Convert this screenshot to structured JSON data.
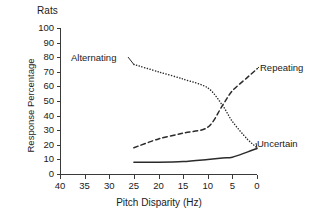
{
  "chart_data": {
    "type": "line",
    "title": "Rats",
    "xlabel": "Pitch Disparity (Hz)",
    "ylabel": "Response Percentage",
    "xlim": [
      40,
      0
    ],
    "ylim": [
      0,
      100
    ],
    "x_reversed": true,
    "grid": false,
    "legend_position": "inline-labels",
    "xticks": [
      40,
      35,
      30,
      25,
      20,
      15,
      10,
      5,
      0
    ],
    "yticks": [
      0,
      10,
      20,
      30,
      40,
      50,
      60,
      70,
      80,
      90,
      100
    ],
    "xtick_labels": [
      "40",
      "35",
      "30",
      "25",
      "20",
      "15",
      "10",
      "5",
      "0"
    ],
    "ytick_labels": [
      "0",
      "10",
      "20",
      "30",
      "40",
      "50",
      "60",
      "70",
      "80",
      "90",
      "100"
    ],
    "x": [
      25,
      20,
      15,
      10,
      7,
      5,
      2,
      0
    ],
    "series": [
      {
        "name": "Alternating",
        "style": "dotted",
        "color": "#2b2b2b",
        "values": [
          75,
          70,
          65,
          59,
          47,
          36,
          24,
          18
        ]
      },
      {
        "name": "Repeating",
        "style": "dashed",
        "color": "#2b2b2b",
        "values": [
          18,
          24,
          28,
          32,
          47,
          57,
          66,
          72
        ]
      },
      {
        "name": "Uncertain",
        "style": "solid",
        "color": "#2b2b2b",
        "values": [
          8,
          8,
          8.5,
          10,
          11,
          11.5,
          15,
          17.5
        ]
      }
    ],
    "annotations": [
      {
        "text": "Alternating",
        "x": 27,
        "y": 80
      },
      {
        "text": "Repeating",
        "x": 1,
        "y": 76
      },
      {
        "text": "Uncertain",
        "x": 1,
        "y": 22
      }
    ]
  }
}
